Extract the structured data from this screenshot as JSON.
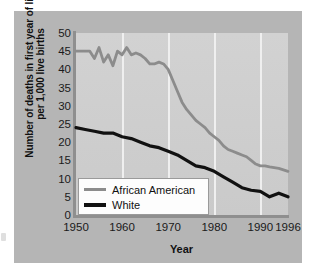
{
  "figure": {
    "background_color": "#b5b5b5",
    "plot_background_color": "#cfcfcf",
    "gridline_color": "#efefef",
    "axis_color": "#8f8f8f"
  },
  "legend": {
    "position": "inside-bottom-left",
    "entries": [
      {
        "label": "African American",
        "color": "#8c8c8c"
      },
      {
        "label": "White",
        "color": "#111111"
      }
    ]
  },
  "chart_data": {
    "type": "line",
    "title": "",
    "xlabel": "Year",
    "ylabel": "Number of deaths in first year of life per 1,000 live births",
    "xlim": [
      1950,
      1996
    ],
    "ylim": [
      0,
      50
    ],
    "ytick_labels": [
      "0",
      "5",
      "10",
      "15",
      "20",
      "25",
      "30",
      "35",
      "40",
      "45",
      "50"
    ],
    "yticks": [
      0,
      5,
      10,
      15,
      20,
      25,
      30,
      35,
      40,
      45,
      50
    ],
    "xtick_labels": [
      "1950",
      "1960",
      "1970",
      "1980",
      "1990",
      "1996"
    ],
    "xticks": [
      1950,
      1960,
      1970,
      1980,
      1990,
      1996
    ],
    "grid": "vertical-only",
    "legend_position": "lower left",
    "series": [
      {
        "name": "African American",
        "color": "#8c8c8c",
        "x": [
          1950,
          1952,
          1953,
          1954,
          1955,
          1956,
          1957,
          1958,
          1959,
          1960,
          1961,
          1962,
          1963,
          1964,
          1965,
          1966,
          1967,
          1968,
          1969,
          1970,
          1971,
          1972,
          1973,
          1974,
          1975,
          1976,
          1977,
          1978,
          1979,
          1980,
          1981,
          1982,
          1983,
          1984,
          1985,
          1986,
          1987,
          1988,
          1989,
          1990,
          1991,
          1992,
          1993,
          1994,
          1995,
          1996
        ],
        "values": [
          45,
          45,
          45,
          43,
          46,
          42,
          44,
          41,
          45,
          44,
          46,
          44,
          44.5,
          44,
          43,
          41.5,
          41.5,
          42,
          41.5,
          40,
          37,
          34,
          31,
          29,
          27.5,
          26,
          25,
          24,
          22.5,
          21.5,
          20.5,
          19,
          18,
          17.5,
          17,
          16.5,
          16,
          15,
          14,
          13.5,
          13.5,
          13.2,
          13,
          12.8,
          12.4,
          12
        ]
      },
      {
        "name": "White",
        "color": "#111111",
        "x": [
          1950,
          1952,
          1954,
          1956,
          1958,
          1960,
          1962,
          1964,
          1966,
          1968,
          1970,
          1972,
          1974,
          1976,
          1978,
          1980,
          1982,
          1984,
          1986,
          1988,
          1990,
          1992,
          1994,
          1996
        ],
        "values": [
          24,
          23.5,
          23,
          22.5,
          22.5,
          21.5,
          21,
          20,
          19,
          18.5,
          17.5,
          16.5,
          15,
          13.5,
          13,
          12,
          10.5,
          9,
          7.5,
          6.8,
          6.5,
          5,
          6,
          5
        ]
      }
    ]
  }
}
